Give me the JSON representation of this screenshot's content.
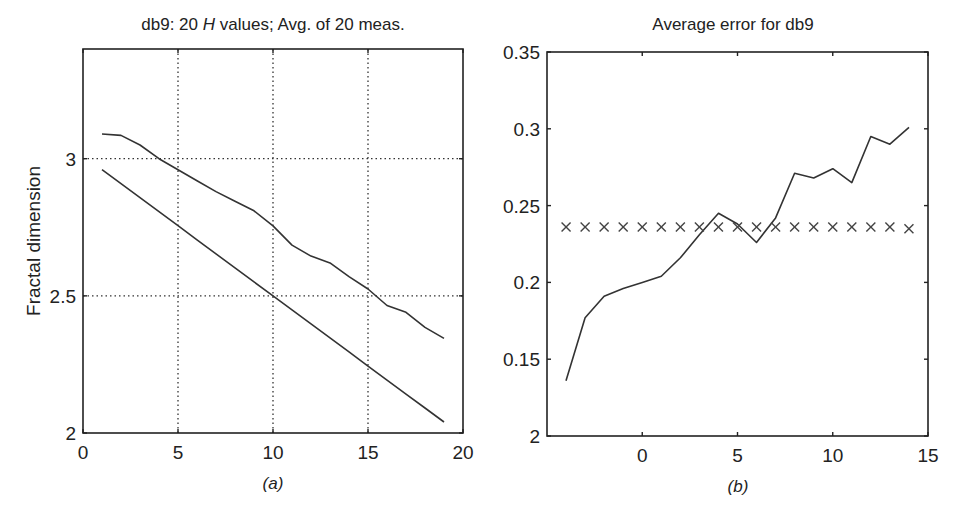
{
  "chart_data": [
    {
      "type": "line",
      "panel": "(a)",
      "title_prefix": "db9: 20 ",
      "title_italic": "H",
      "title_suffix": " values; Avg. of 20 meas.",
      "xlabel": "",
      "ylabel": "Fractal dimension",
      "caption": "a",
      "xlim": [
        0,
        20
      ],
      "ylim": [
        2,
        3.4
      ],
      "grid": true,
      "xticks": [
        0,
        5,
        10,
        15,
        20
      ],
      "xtick_labels": [
        "0",
        "5",
        "10",
        "15",
        "20"
      ],
      "yticks": [
        2,
        2.5,
        3
      ],
      "ytick_labels": [
        "2",
        "2.5",
        "3"
      ],
      "x": [
        1,
        2,
        3,
        4,
        5,
        6,
        7,
        8,
        9,
        10,
        11,
        12,
        13,
        14,
        15,
        16,
        17,
        18,
        19
      ],
      "series": [
        {
          "name": "estimated",
          "values": [
            3.09,
            3.085,
            3.05,
            3.0,
            2.96,
            2.92,
            2.88,
            2.845,
            2.81,
            2.755,
            2.685,
            2.645,
            2.62,
            2.57,
            2.525,
            2.465,
            2.44,
            2.385,
            2.345
          ]
        },
        {
          "name": "true",
          "values": [
            2.96,
            2.909,
            2.858,
            2.807,
            2.756,
            2.704,
            2.653,
            2.602,
            2.551,
            2.5,
            2.449,
            2.398,
            2.347,
            2.296,
            2.244,
            2.193,
            2.142,
            2.091,
            2.04
          ]
        }
      ]
    },
    {
      "type": "line",
      "panel": "(b)",
      "title": "Average error for db9",
      "xlabel": "",
      "ylabel": "",
      "caption": "b",
      "xlim": [
        -5,
        15
      ],
      "ylim": [
        0.1,
        0.35
      ],
      "grid": false,
      "xticks": [
        0,
        5,
        10,
        15
      ],
      "xtick_labels": [
        "0",
        "5",
        "10",
        "15"
      ],
      "yticks": [
        0.1,
        0.15,
        0.2,
        0.25,
        0.3,
        0.35
      ],
      "ytick_labels": [
        "2",
        "0.15",
        "0.2",
        "0.25",
        "0.3",
        "0.35"
      ],
      "x": [
        -4,
        -3,
        -2,
        -1,
        0,
        1,
        2,
        3,
        4,
        5,
        6,
        7,
        8,
        9,
        10,
        11,
        12,
        13,
        14
      ],
      "series": [
        {
          "name": "error",
          "style": "line",
          "values": [
            0.136,
            0.177,
            0.191,
            0.196,
            0.2,
            0.204,
            0.216,
            0.231,
            0.245,
            0.238,
            0.226,
            0.242,
            0.271,
            0.268,
            0.274,
            0.265,
            0.295,
            0.29,
            0.301
          ]
        },
        {
          "name": "mean error",
          "style": "x-markers",
          "values": [
            0.236,
            0.236,
            0.236,
            0.236,
            0.236,
            0.236,
            0.236,
            0.236,
            0.236,
            0.236,
            0.236,
            0.236,
            0.236,
            0.236,
            0.236,
            0.236,
            0.236,
            0.236,
            0.235
          ]
        }
      ]
    }
  ]
}
